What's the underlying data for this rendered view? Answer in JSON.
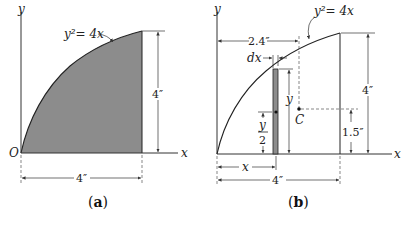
{
  "figure_a": {
    "caption": "a",
    "axis_x_label": "x",
    "axis_y_label": "y",
    "origin_label": "O",
    "curve_label": "y²= 4x",
    "height_dim": "4″",
    "width_dim": "4″",
    "fill_color": "#8c8c8c"
  },
  "figure_b": {
    "caption": "b",
    "axis_x_label": "x",
    "axis_y_label": "y",
    "curve_label": "y²= 4x",
    "centroid_x_dim": "2.4″",
    "strip_width_label": "dx",
    "strip_height_label": "y",
    "strip_centroid_num": "y",
    "strip_centroid_den": "2",
    "strip_x_label": "x",
    "centroid_label": "C",
    "centroid_y_dim": "1.5″",
    "height_dim": "4″",
    "width_dim": "4″",
    "strip_color": "#8c8c8c"
  }
}
